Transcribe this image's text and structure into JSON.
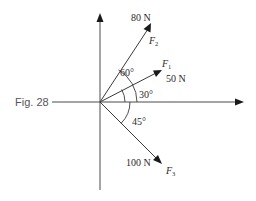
{
  "figure": {
    "label": "Fig. 28"
  },
  "origin": {
    "x": 100,
    "y": 102
  },
  "forces": [
    {
      "name": "F",
      "subscript": "2",
      "magnitude": "80 N",
      "angle_from_horizontal_deg": 60,
      "direction": "up-right"
    },
    {
      "name": "F",
      "subscript": "1",
      "magnitude": "50 N",
      "angle_from_horizontal_deg": 30,
      "direction": "up-right"
    },
    {
      "name": "F",
      "subscript": "3",
      "magnitude": "100 N",
      "angle_from_horizontal_deg": -45,
      "direction": "down-right"
    }
  ],
  "angles": [
    {
      "label": "60°",
      "between": "x-axis and F2"
    },
    {
      "label": "30°",
      "between": "x-axis and F1"
    },
    {
      "label": "45°",
      "between": "x-axis and F3"
    }
  ],
  "axes": {
    "horizontal": "positive x arrow to the right",
    "vertical": "positive y arrow upward"
  }
}
